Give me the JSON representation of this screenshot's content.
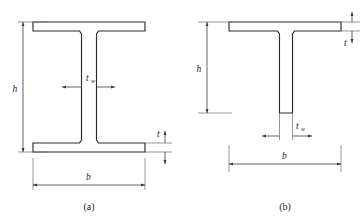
{
  "figure": {
    "type": "engineering-cross-section-diagram",
    "background_color": "#ffffff",
    "line_color": "#2b2b2b",
    "dimension_color": "#3a3a3a",
    "panels": [
      {
        "id": "panel-a",
        "caption": "(a)",
        "shape_name": "I-section",
        "dimensions": [
          {
            "name": "height",
            "label": "h",
            "subscript": "",
            "position": "left",
            "orientation": "vertical"
          },
          {
            "name": "web-thickness",
            "label": "t",
            "subscript": "w",
            "position": "center",
            "orientation": "horizontal"
          },
          {
            "name": "flange-thickness",
            "label": "t",
            "subscript": "",
            "position": "right",
            "orientation": "vertical"
          },
          {
            "name": "width",
            "label": "b",
            "subscript": "",
            "position": "bottom",
            "orientation": "horizontal"
          }
        ]
      },
      {
        "id": "panel-b",
        "caption": "(b)",
        "shape_name": "T-section",
        "dimensions": [
          {
            "name": "height",
            "label": "h",
            "subscript": "",
            "position": "left",
            "orientation": "vertical"
          },
          {
            "name": "flange-thickness",
            "label": "t",
            "subscript": "",
            "position": "right",
            "orientation": "vertical"
          },
          {
            "name": "web-thickness",
            "label": "t",
            "subscript": "w",
            "position": "bottom-center",
            "orientation": "horizontal"
          },
          {
            "name": "width",
            "label": "b",
            "subscript": "",
            "position": "bottom",
            "orientation": "horizontal"
          }
        ]
      }
    ],
    "labels": {
      "h": "h",
      "b": "b",
      "t": "t",
      "t_base": "t",
      "t_sub": "w",
      "caption_a": "(a)",
      "caption_b": "(b)"
    }
  }
}
